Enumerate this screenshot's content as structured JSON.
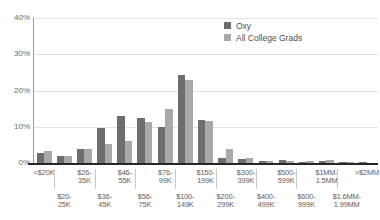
{
  "chart_data": {
    "type": "bar",
    "title": "",
    "xlabel": "",
    "ylabel": "",
    "ylim": [
      0,
      40
    ],
    "yticks": [
      "0%",
      "10%",
      "20%",
      "30%",
      "40%"
    ],
    "ytick_values": [
      0,
      10,
      20,
      30,
      40
    ],
    "grid": true,
    "legend_position": "top-center",
    "categories": [
      "<$20K",
      "$20-25K",
      "$26-35K",
      "$36-45K",
      "$46-55K",
      "$56-75K",
      "$76-99K",
      "$100-149K",
      "$150-199K",
      "$200-299K",
      "$300-399K",
      "$400-499K",
      "$500-599K",
      "$600-999K",
      "$1MM-1.5MM",
      "$1.6MM-1.99MM",
      ">$2MM"
    ],
    "category_lines": [
      [
        "<$20K",
        ""
      ],
      [
        "$20-",
        "25K"
      ],
      [
        "$26-",
        "35K"
      ],
      [
        "$36-",
        "45K"
      ],
      [
        "$46-",
        "55K"
      ],
      [
        "$56-",
        "75K"
      ],
      [
        "$76-",
        "99K"
      ],
      [
        "$100-",
        "149K"
      ],
      [
        "$150-",
        "199K"
      ],
      [
        "$200-",
        "299K"
      ],
      [
        "$300-",
        "399K"
      ],
      [
        "$400-",
        "499K"
      ],
      [
        "$500-",
        "599K"
      ],
      [
        "$600-",
        "999K"
      ],
      [
        "$1MM-",
        "1.5MM"
      ],
      [
        "$1.6MM-",
        "1.99MM"
      ],
      [
        ">$2MM",
        ""
      ]
    ],
    "series": [
      {
        "name": "Oxy",
        "color": "#6e6e6e",
        "values": [
          2.8,
          2.0,
          3.8,
          9.7,
          13.0,
          12.5,
          9.9,
          24.2,
          12.0,
          1.3,
          1.1,
          0.6,
          0.7,
          0.4,
          0.5,
          0.2,
          0.2
        ]
      },
      {
        "name": "All College Grads",
        "color": "#a9a9a9",
        "values": [
          3.2,
          1.9,
          3.9,
          5.2,
          6.2,
          11.4,
          14.8,
          23.0,
          11.6,
          3.8,
          1.4,
          0.5,
          0.6,
          0.5,
          0.8,
          0.2,
          0.0
        ]
      }
    ]
  },
  "legend": {
    "items": [
      {
        "label": "Oxy",
        "color": "#6e6e6e"
      },
      {
        "label": "All College Grads",
        "color": "#a9a9a9"
      }
    ]
  }
}
